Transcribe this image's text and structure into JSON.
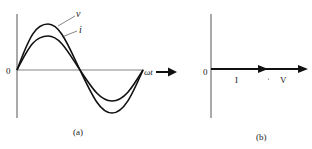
{
  "panel_a": {
    "caption": "(a)",
    "origin_label": "0",
    "axis_label": "ωt",
    "curves": [
      {
        "name": "v",
        "label": "v",
        "amplitude": "larger"
      },
      {
        "name": "i",
        "label": "i",
        "amplitude": "smaller"
      }
    ],
    "description": "Voltage v and current i sinusoids in phase versus ωt"
  },
  "panel_b": {
    "caption": "(b)",
    "origin_label": "0",
    "phasors": [
      {
        "name": "I",
        "label": "I"
      },
      {
        "name": "V",
        "label": "V"
      }
    ],
    "description": "Phasors I and V collinear (in phase)"
  },
  "colors": {
    "ink": "#111111",
    "axis": "#555555",
    "background": "#ffffff"
  }
}
